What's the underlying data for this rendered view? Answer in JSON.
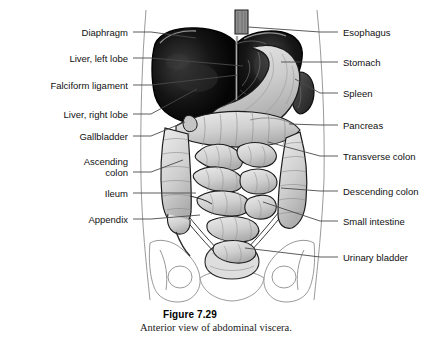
{
  "figure": {
    "number": "Figure 7.29",
    "caption": "Anterior view of abdominal viscera.",
    "subject": "anterior view of abdominal viscera",
    "colors": {
      "liver": "#0d0d0d",
      "stomach": "#cfcfcf",
      "spleen": "#3a3a3a",
      "intestine": "#d9d9d9",
      "bladder": "#dcdcdc",
      "outline": "#111111",
      "body_outline": "#9a9a9a",
      "leader_line": "#4a4a4a",
      "text": "#111111",
      "background": "#ffffff"
    }
  },
  "labels_left": [
    {
      "text": "Diaphragm",
      "x": 128,
      "y": 27,
      "lx": 133,
      "ly": 32,
      "tx": 196,
      "ty": 38
    },
    {
      "text": "Liver, left lobe",
      "x": 128,
      "y": 53,
      "lx": 133,
      "ly": 58,
      "tx": 243,
      "ty": 66
    },
    {
      "text": "Falciform ligament",
      "x": 128,
      "y": 80,
      "lx": 133,
      "ly": 85,
      "tx": 238,
      "ty": 75
    },
    {
      "text": "Liver, right lobe",
      "x": 128,
      "y": 109,
      "lx": 133,
      "ly": 114,
      "tx": 197,
      "ty": 89
    },
    {
      "text": "Gallbladder",
      "x": 128,
      "y": 131,
      "lx": 133,
      "ly": 136,
      "tx": 185,
      "ty": 122
    },
    {
      "text": "Ascending",
      "x": 128,
      "y": 156,
      "lx": 133,
      "ly": 172,
      "tx": 183,
      "ty": 160
    },
    {
      "text": "colon",
      "x": 128,
      "y": 167,
      "lx": null,
      "ly": null,
      "tx": null,
      "ty": null
    },
    {
      "text": "Ileum",
      "x": 128,
      "y": 188,
      "lx": 133,
      "ly": 193,
      "tx": 196,
      "ty": 193
    },
    {
      "text": "Appendix",
      "x": 128,
      "y": 214,
      "lx": 133,
      "ly": 219,
      "tx": 200,
      "ty": 215
    }
  ],
  "labels_right": [
    {
      "text": "Esophagus",
      "x": 343,
      "y": 27,
      "lx": 338,
      "ly": 32,
      "tx": 248,
      "ty": 27
    },
    {
      "text": "Stomach",
      "x": 343,
      "y": 57,
      "lx": 338,
      "ly": 62,
      "tx": 281,
      "ty": 62
    },
    {
      "text": "Spleen",
      "x": 343,
      "y": 88,
      "lx": 338,
      "ly": 93,
      "tx": 295,
      "ty": 79
    },
    {
      "text": "Pancreas",
      "x": 343,
      "y": 120,
      "lx": 338,
      "ly": 125,
      "tx": 289,
      "ty": 124
    },
    {
      "text": "Transverse colon",
      "x": 343,
      "y": 151,
      "lx": 338,
      "ly": 156,
      "tx": 268,
      "ty": 142
    },
    {
      "text": "Descending colon",
      "x": 343,
      "y": 186,
      "lx": 338,
      "ly": 191,
      "tx": 281,
      "ty": 188
    },
    {
      "text": "Small intestine",
      "x": 343,
      "y": 216,
      "lx": 338,
      "ly": 221,
      "tx": 263,
      "ty": 202
    },
    {
      "text": "Urinary bladder",
      "x": 343,
      "y": 252,
      "lx": 338,
      "ly": 257,
      "tx": 245,
      "ty": 248
    }
  ]
}
